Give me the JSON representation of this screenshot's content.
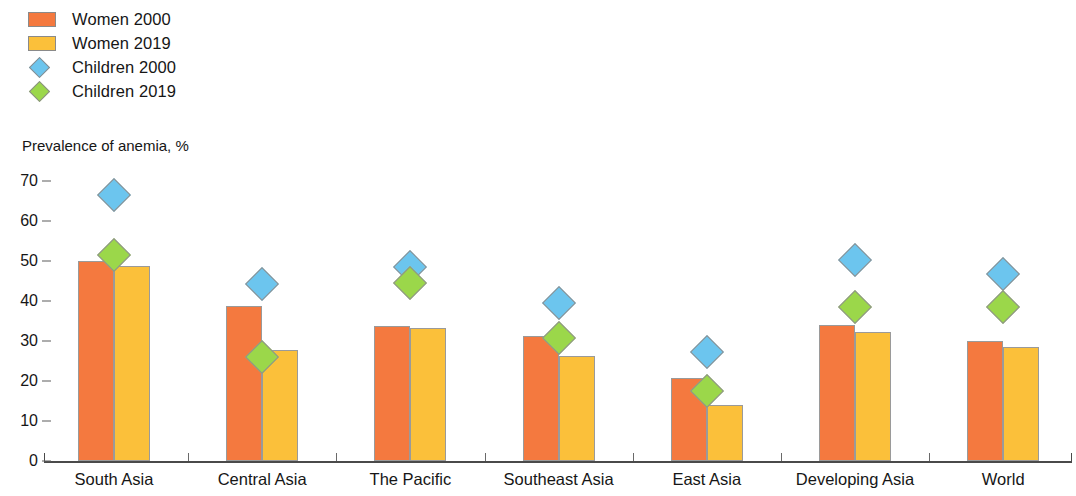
{
  "legend": {
    "items": [
      {
        "label": "Women 2000",
        "marker": "square-swatch-icon",
        "color": "#F4793F"
      },
      {
        "label": "Women 2019",
        "marker": "square-swatch-icon",
        "color": "#FBC03A"
      },
      {
        "label": "Children 2000",
        "marker": "diamond-marker-icon",
        "color": "#6CC5EE"
      },
      {
        "label": "Children 2019",
        "marker": "diamond-marker-icon",
        "color": "#9BD74A"
      }
    ]
  },
  "axis_title": "Prevalence of anemia, %",
  "y_ticks": [
    "70",
    "60",
    "50",
    "40",
    "30",
    "20",
    "10",
    "0"
  ],
  "categories": [
    "South Asia",
    "Central Asia",
    "The Pacific",
    "Southeast Asia",
    "East Asia",
    "Developing Asia",
    "World"
  ],
  "chart_data": {
    "type": "bar",
    "title": "",
    "subtitle": "",
    "xlabel": "",
    "ylabel": "Prevalence of anemia, %",
    "ylim": [
      0,
      70
    ],
    "yticks": [
      0,
      10,
      20,
      30,
      40,
      50,
      60,
      70
    ],
    "grid": false,
    "legend_position": "top-left",
    "categories": [
      "South Asia",
      "Central Asia",
      "The Pacific",
      "Southeast Asia",
      "East Asia",
      "Developing Asia",
      "World"
    ],
    "series": [
      {
        "name": "Women 2000",
        "kind": "bar",
        "color": "#F4793F",
        "values": [
          50.0,
          38.8,
          33.8,
          31.3,
          20.8,
          34.0,
          30.0
        ]
      },
      {
        "name": "Women 2019",
        "kind": "bar",
        "color": "#FBC03A",
        "values": [
          48.7,
          27.8,
          33.3,
          26.3,
          14.0,
          32.3,
          28.5
        ]
      },
      {
        "name": "Children 2000",
        "kind": "marker",
        "marker": "diamond",
        "color": "#6CC5EE",
        "values": [
          66.5,
          44.3,
          48.5,
          39.5,
          27.3,
          50.3,
          46.8
        ]
      },
      {
        "name": "Children 2019",
        "kind": "marker",
        "marker": "diamond",
        "color": "#9BD74A",
        "values": [
          51.5,
          26.0,
          44.5,
          30.8,
          17.5,
          38.5,
          38.5
        ]
      }
    ]
  },
  "geometry": {
    "baseline_y": 461,
    "px_per_unit": 4.0,
    "group_start_x": 78,
    "group_pitch": 148.2,
    "bar_width": 36
  }
}
